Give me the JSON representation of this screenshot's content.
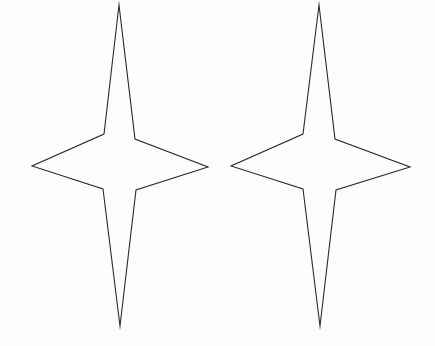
{
  "figure": {
    "background_color": "#fdfdfd",
    "stroke_color": "#2b2b2b",
    "stroke_width": 1.1,
    "fill": "none",
    "canvas": {
      "width": 435,
      "height": 346
    },
    "shape_count": 2,
    "shape_type": "four-pointed-star"
  },
  "shapes": [
    {
      "name": "left-star",
      "label": "Left four-pointed star",
      "center": {
        "x": 120,
        "y": 166
      },
      "tips": {
        "top": {
          "x": 119,
          "y": 5
        },
        "bottom": {
          "x": 120,
          "y": 326
        },
        "left": {
          "x": 32,
          "y": 166
        },
        "right": {
          "x": 208,
          "y": 167
        }
      },
      "inner_vertices": {
        "top_left": {
          "x": 104,
          "y": 134
        },
        "top_right": {
          "x": 135,
          "y": 139
        },
        "bottom_right": {
          "x": 136,
          "y": 190
        },
        "bottom_left": {
          "x": 103,
          "y": 189
        }
      },
      "points": "119,5 104,134 32,166 103,189 120,326 136,190 208,167 135,139"
    },
    {
      "name": "right-star",
      "label": "Right four-pointed star",
      "center": {
        "x": 320,
        "y": 166
      },
      "tips": {
        "top": {
          "x": 319,
          "y": 5
        },
        "bottom": {
          "x": 320,
          "y": 326
        },
        "left": {
          "x": 231,
          "y": 166
        },
        "right": {
          "x": 410,
          "y": 167
        }
      },
      "inner_vertices": {
        "top_left": {
          "x": 303,
          "y": 134
        },
        "top_right": {
          "x": 335,
          "y": 139
        },
        "bottom_right": {
          "x": 336,
          "y": 190
        },
        "bottom_left": {
          "x": 303,
          "y": 189
        }
      },
      "points": "319,5 303,134 231,166 303,189 320,326 336,190 410,167 335,139"
    }
  ]
}
